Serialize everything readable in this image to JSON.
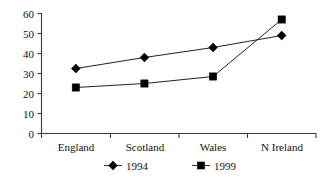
{
  "chart_data": {
    "type": "line",
    "title": "",
    "subtitle": "",
    "xlabel": "",
    "ylabel": "",
    "categories": [
      "England",
      "Scotland",
      "Wales",
      "N Ireland"
    ],
    "series": [
      {
        "name": "1994",
        "marker": "diamond",
        "values": [
          32.5,
          38,
          43,
          49
        ]
      },
      {
        "name": "1999",
        "marker": "square",
        "values": [
          23,
          25,
          28.5,
          57
        ]
      }
    ],
    "ylim": [
      0,
      60
    ],
    "yticks": [
      0,
      10,
      20,
      30,
      40,
      50,
      60
    ],
    "ytick_labels": [
      "0",
      "10",
      "20",
      "30",
      "40",
      "50",
      "60"
    ],
    "grid": false,
    "legend_position": "bottom",
    "legend": [
      {
        "label": "1994",
        "marker": "diamond"
      },
      {
        "label": "1999",
        "marker": "square"
      }
    ],
    "colors": {
      "series_1994": "#000000",
      "series_1999": "#000000",
      "axis": "#3a3a3a",
      "background": "#ffffff",
      "text": "#111111"
    }
  }
}
